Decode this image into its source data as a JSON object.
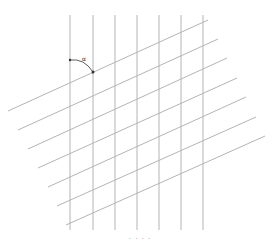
{
  "diagram": {
    "type": "skewed-grid",
    "line_color": "#b4b4b4",
    "accent_color": "#333333",
    "vertical_lines": {
      "x": [
        70,
        93,
        115,
        137,
        159,
        181,
        203
      ],
      "y_top": 15,
      "y_bottom": 230
    },
    "diagonal_lines": [
      {
        "x1": 8,
        "y1": 111,
        "x2": 208,
        "y2": 20
      },
      {
        "x1": 18,
        "y1": 130,
        "x2": 218,
        "y2": 39
      },
      {
        "x1": 28,
        "y1": 149,
        "x2": 227,
        "y2": 58
      },
      {
        "x1": 38,
        "y1": 168,
        "x2": 237,
        "y2": 78
      },
      {
        "x1": 48,
        "y1": 187,
        "x2": 246,
        "y2": 97
      },
      {
        "x1": 57,
        "y1": 206,
        "x2": 256,
        "y2": 117
      },
      {
        "x1": 66,
        "y1": 225,
        "x2": 265,
        "y2": 136
      }
    ],
    "angle_marker": {
      "start": {
        "x": 70,
        "y": 60
      },
      "end": {
        "x": 93,
        "y": 72
      },
      "label": "α"
    },
    "caption": "· · · ·"
  }
}
